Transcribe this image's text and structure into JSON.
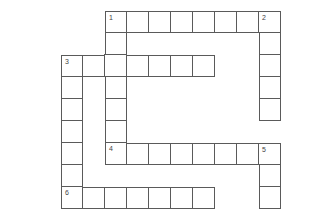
{
  "puzzle": {
    "type": "crossword",
    "origin_x": 61,
    "origin_y": 11,
    "cell_size": 22,
    "line_color": "#5a5a5a",
    "entries": [
      {
        "number": "1",
        "direction": "across",
        "row": 0,
        "col": 2,
        "length": 8
      },
      {
        "number": "2",
        "direction": "down",
        "row": 0,
        "col": 9,
        "length": 5
      },
      {
        "number": "1",
        "direction": "down",
        "row": 0,
        "col": 2,
        "length": 7
      },
      {
        "number": "3",
        "direction": "across",
        "row": 2,
        "col": 0,
        "length": 7
      },
      {
        "number": "3",
        "direction": "down",
        "row": 2,
        "col": 0,
        "length": 7
      },
      {
        "number": "4",
        "direction": "across",
        "row": 6,
        "col": 2,
        "length": 8
      },
      {
        "number": "5",
        "direction": "down",
        "row": 6,
        "col": 9,
        "length": 3
      },
      {
        "number": "6",
        "direction": "across",
        "row": 8,
        "col": 0,
        "length": 7
      }
    ],
    "numbers": [
      {
        "label": "1",
        "row": 0,
        "col": 2
      },
      {
        "label": "2",
        "row": 0,
        "col": 9
      },
      {
        "label": "3",
        "row": 2,
        "col": 0
      },
      {
        "label": "4",
        "row": 6,
        "col": 2
      },
      {
        "label": "5",
        "row": 6,
        "col": 9
      },
      {
        "label": "6",
        "row": 8,
        "col": 0
      }
    ]
  }
}
